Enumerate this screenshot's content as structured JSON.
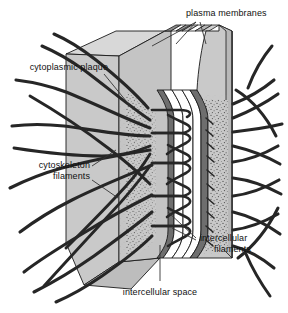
{
  "figure": {
    "name": "desmosome-cell-junction-diagram",
    "type": "biological-structure-diagram",
    "background": "#ffffff"
  },
  "labels": {
    "plasma_membranes": "plasma membranes",
    "cytoplasmic_plaque": "cytoplasmic plaque",
    "cytoskeleton_filaments_line1": "cytoskeleton",
    "cytoskeleton_filaments_line2": "filaments",
    "intercellular_filaments_line1": "intercellular",
    "intercellular_filaments_line2": "filaments",
    "intercellular_space": "intercellular space"
  },
  "colors": {
    "cytoplasm_slab": "#c9c9c9",
    "slab_top_face": "#d6d6d6",
    "slab_bottom_face": "#bdbdbd",
    "membrane_dark": "#6e6e6e",
    "membrane_line": "#2b2b2b",
    "intercellular_space": "#ffffff",
    "plaque_stipple": "#3a3a3a",
    "filament": "#262626",
    "outline": "#1a1a1a",
    "label_text": "#111111",
    "leader_line": "#333333"
  },
  "structures": [
    {
      "name": "cytoplasmic-slab-left",
      "description": "left cell cytoplasm block in 3D perspective"
    },
    {
      "name": "cytoplasmic-slab-right",
      "description": "right cell cytoplasm block in 3D perspective"
    },
    {
      "name": "plasma-membrane-left",
      "description": "left cell plasma membrane bilayer"
    },
    {
      "name": "plasma-membrane-right",
      "description": "right cell plasma membrane bilayer"
    },
    {
      "name": "intercellular-space-gap",
      "description": "white gap between the two plasma membranes"
    },
    {
      "name": "cytoplasmic-plaque-left",
      "description": "stippled dense plaque on inner face of left membrane"
    },
    {
      "name": "cytoplasmic-plaque-right",
      "description": "stippled dense plaque on inner face of right membrane"
    },
    {
      "name": "intercellular-filaments",
      "description": "looped cadherin filaments bridging the intercellular space"
    },
    {
      "name": "cytoskeleton-filaments-left",
      "description": "intermediate filaments fanning into left cytoplasm"
    },
    {
      "name": "cytoskeleton-filaments-right",
      "description": "intermediate filaments fanning into right cytoplasm"
    }
  ],
  "leaders": {
    "plasma_membranes": 2,
    "cytoplasmic_plaque": 1,
    "cytoskeleton_filaments": 2,
    "intercellular_filaments": 2,
    "intercellular_space": 1
  }
}
